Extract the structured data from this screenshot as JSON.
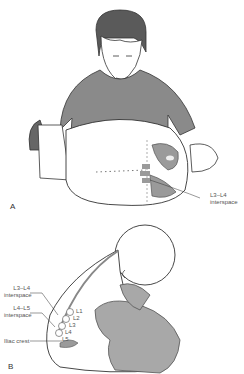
{
  "figure": {
    "panels": [
      {
        "id": "A",
        "letter": "A",
        "description": "Adult seated holding infant in lateral decubitus position for lumbar puncture",
        "labels": [
          {
            "line1": "L3–L4",
            "line2": "interspace"
          }
        ]
      },
      {
        "id": "B",
        "letter": "B",
        "description": "Infant held in sitting flexed position with lumbar spine landmarks",
        "labels": [
          {
            "line1": "L3–L4",
            "line2": "interspace"
          },
          {
            "line1": "L4–L5",
            "line2": "interspace"
          },
          {
            "line1": "Iliac crest",
            "line2": ""
          }
        ],
        "vertebrae": [
          "L1",
          "L2",
          "L3",
          "L4",
          "L5"
        ]
      }
    ],
    "colors": {
      "shirt": "#8a8a8a",
      "hair": "#5a5a5a",
      "skin": "#ffffff",
      "outline": "#333333",
      "bone": "#9a9a9a",
      "glove": "#a8a8a8"
    }
  }
}
